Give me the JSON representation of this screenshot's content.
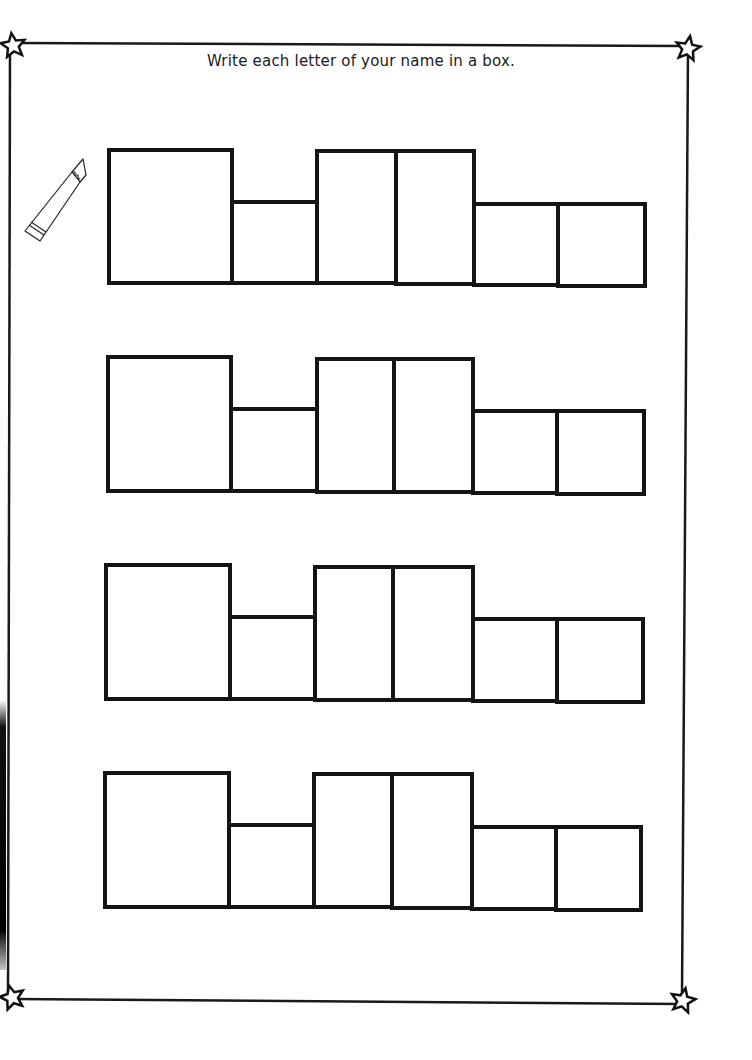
{
  "worksheet": {
    "instruction": "Write each letter of your name in a box.",
    "border_color": "#1a1a1a",
    "corner_icons": [
      "star-icon",
      "star-icon",
      "star-icon",
      "star-icon"
    ],
    "decoration_icon": "pencil-icon",
    "rows": [
      {
        "label": "name-row-1",
        "boxes": [
          {
            "type": "tall",
            "x": 107,
            "y": 148,
            "w": 127,
            "h": 137
          },
          {
            "type": "short",
            "x": 230,
            "y": 200,
            "w": 89,
            "h": 85
          },
          {
            "type": "tall",
            "x": 315,
            "y": 149,
            "w": 83,
            "h": 136
          },
          {
            "type": "tall",
            "x": 394,
            "y": 149,
            "w": 82,
            "h": 137
          },
          {
            "type": "short",
            "x": 472,
            "y": 202,
            "w": 88,
            "h": 85
          },
          {
            "type": "short",
            "x": 556,
            "y": 202,
            "w": 91,
            "h": 86
          }
        ]
      },
      {
        "label": "name-row-2",
        "boxes": [
          {
            "type": "tall",
            "x": 106,
            "y": 355,
            "w": 127,
            "h": 138
          },
          {
            "type": "short",
            "x": 229,
            "y": 407,
            "w": 90,
            "h": 86
          },
          {
            "type": "tall",
            "x": 315,
            "y": 357,
            "w": 81,
            "h": 137
          },
          {
            "type": "tall",
            "x": 392,
            "y": 357,
            "w": 83,
            "h": 137
          },
          {
            "type": "short",
            "x": 471,
            "y": 409,
            "w": 88,
            "h": 86
          },
          {
            "type": "short",
            "x": 555,
            "y": 409,
            "w": 91,
            "h": 87
          }
        ]
      },
      {
        "label": "name-row-3",
        "boxes": [
          {
            "type": "tall",
            "x": 104,
            "y": 563,
            "w": 128,
            "h": 138
          },
          {
            "type": "short",
            "x": 228,
            "y": 615,
            "w": 89,
            "h": 86
          },
          {
            "type": "tall",
            "x": 313,
            "y": 565,
            "w": 82,
            "h": 137
          },
          {
            "type": "tall",
            "x": 391,
            "y": 565,
            "w": 84,
            "h": 137
          },
          {
            "type": "short",
            "x": 471,
            "y": 617,
            "w": 88,
            "h": 86
          },
          {
            "type": "short",
            "x": 555,
            "y": 617,
            "w": 90,
            "h": 87
          }
        ]
      },
      {
        "label": "name-row-4",
        "boxes": [
          {
            "type": "tall",
            "x": 103,
            "y": 771,
            "w": 128,
            "h": 138
          },
          {
            "type": "short",
            "x": 227,
            "y": 823,
            "w": 89,
            "h": 86
          },
          {
            "type": "tall",
            "x": 312,
            "y": 772,
            "w": 82,
            "h": 137
          },
          {
            "type": "tall",
            "x": 390,
            "y": 772,
            "w": 84,
            "h": 138
          },
          {
            "type": "short",
            "x": 470,
            "y": 825,
            "w": 88,
            "h": 86
          },
          {
            "type": "short",
            "x": 554,
            "y": 825,
            "w": 89,
            "h": 87
          }
        ]
      }
    ]
  }
}
